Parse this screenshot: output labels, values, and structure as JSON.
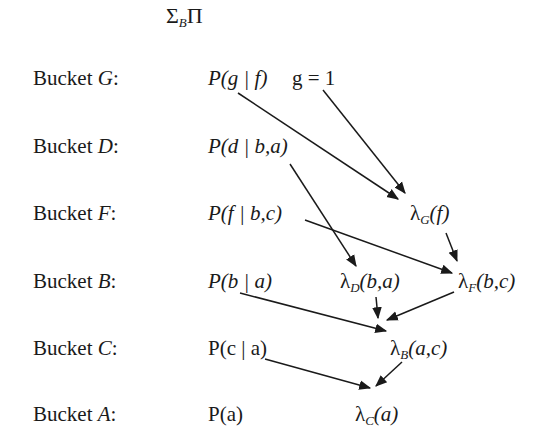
{
  "header": {
    "sigma": "Σ",
    "subscript": "B",
    "pi": "Π"
  },
  "buckets": [
    {
      "label": "Bucket G:",
      "functions": [
        "P(g | f)",
        "g = 1"
      ],
      "messages": []
    },
    {
      "label": "Bucket D:",
      "functions": [
        "P(d | b,a)"
      ],
      "messages": []
    },
    {
      "label": "Bucket F:",
      "functions": [
        "P(f | b,c)"
      ],
      "messages": [
        "λG(f)"
      ]
    },
    {
      "label": "Bucket B:",
      "functions": [
        "P(b | a)"
      ],
      "messages": [
        "λD(b,a)",
        "λF(b,c)"
      ]
    },
    {
      "label": "Bucket C:",
      "functions": [
        "P(c | a)"
      ],
      "messages": [
        "λB(a,c)"
      ]
    },
    {
      "label": "Bucket A:",
      "functions": [
        "P(a)"
      ],
      "messages": [
        "λC(a)"
      ]
    }
  ],
  "labels": {
    "g_pre": "Bucket ",
    "g_var": "G",
    "g_post": ":",
    "d_pre": "Bucket ",
    "d_var": "D",
    "d_post": ":",
    "f_pre": "Bucket ",
    "f_var": "F",
    "f_post": ":",
    "b_pre": "Bucket ",
    "b_var": "B",
    "b_post": ":",
    "c_pre": "Bucket ",
    "c_var": "C",
    "c_post": ":",
    "a_pre": "Bucket ",
    "a_var": "A",
    "a_post": ":"
  },
  "funcs": {
    "pgf": "P(g | f)",
    "g_eq": "g = 1",
    "pdba": "P(d | b,a)",
    "pfbc": "P(f | b,c)",
    "pba": "P(b | a)",
    "pca": "P(c | a)",
    "pa": "P(a)"
  },
  "lambdas": {
    "lg": {
      "sym": "λ",
      "sub": "G",
      "args": "(f)"
    },
    "ld": {
      "sym": "λ",
      "sub": "D",
      "args": "(b,a)"
    },
    "lf": {
      "sym": "λ",
      "sub": "F",
      "args": "(b,c)"
    },
    "lb": {
      "sym": "λ",
      "sub": "B",
      "args": "(a,c)"
    },
    "lc": {
      "sym": "λ",
      "sub": "C",
      "args": "(a)"
    }
  },
  "arrows": [
    {
      "from": "P(g | f)",
      "to": "λG(f)"
    },
    {
      "from": "g = 1",
      "to": "λG(f)"
    },
    {
      "from": "P(d | b,a)",
      "to": "λD(b,a)"
    },
    {
      "from": "P(f | b,c)",
      "to": "λF(b,c)"
    },
    {
      "from": "λG(f)",
      "to": "λF(b,c)"
    },
    {
      "from": "P(b | a)",
      "to": "λB(a,c)"
    },
    {
      "from": "λD(b,a)",
      "to": "λB(a,c)"
    },
    {
      "from": "λF(b,c)",
      "to": "λB(a,c)"
    },
    {
      "from": "P(c | a)",
      "to": "λC(a)"
    },
    {
      "from": "λB(a,c)",
      "to": "λC(a)"
    }
  ]
}
